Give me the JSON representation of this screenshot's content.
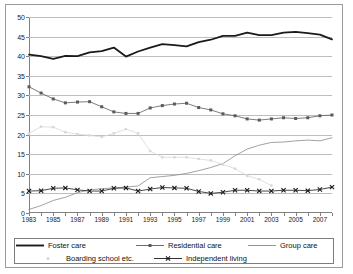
{
  "chart_data": {
    "type": "line",
    "title": "",
    "subtitle": "",
    "xlabel": "",
    "ylabel": "",
    "xlim": [
      1983,
      2008
    ],
    "ylim": [
      0,
      50
    ],
    "ytick_step": 5,
    "yticks": [
      0,
      5,
      10,
      15,
      20,
      25,
      30,
      35,
      40,
      45,
      50
    ],
    "ytick_labels": [
      "0",
      "5",
      "10",
      "15",
      "20",
      "25",
      "30",
      "35",
      "40",
      "45",
      "50"
    ],
    "x": [
      1983,
      1984,
      1985,
      1986,
      1987,
      1988,
      1989,
      1990,
      1991,
      1992,
      1993,
      1994,
      1995,
      1996,
      1997,
      1998,
      1999,
      2000,
      2001,
      2002,
      2003,
      2004,
      2005,
      2006,
      2007,
      2008
    ],
    "xtick_labels": [
      "1983",
      "1985",
      "1987",
      "1989",
      "1991",
      "1993",
      "1995",
      "1997",
      "1999",
      "2001",
      "2003",
      "2005",
      "2007"
    ],
    "xticks_shown": [
      1983,
      1985,
      1987,
      1989,
      1991,
      1993,
      1995,
      1997,
      1999,
      2001,
      2003,
      2005,
      2007
    ],
    "grid": true,
    "grid_axis": "y",
    "legend_position": "bottom",
    "series": [
      {
        "name": "Foster care",
        "color": "#1a1a1a",
        "marker": "none",
        "width": 1.8,
        "values": [
          40.4,
          40.0,
          39.3,
          40.1,
          40.0,
          41.0,
          41.3,
          42.2,
          39.9,
          41.2,
          42.2,
          43.1,
          42.8,
          42.5,
          43.6,
          44.2,
          45.2,
          45.2,
          46.0,
          45.4,
          45.4,
          46.0,
          46.2,
          45.9,
          45.5,
          44.3
        ]
      },
      {
        "name": "Residential care",
        "color": "#5a5a5a",
        "marker": "square",
        "width": 0.8,
        "values": [
          32.2,
          30.6,
          29.1,
          28.1,
          28.3,
          28.4,
          27.1,
          25.8,
          25.4,
          25.4,
          26.8,
          27.4,
          27.8,
          28.0,
          26.9,
          26.3,
          25.3,
          24.8,
          24.0,
          23.7,
          24.0,
          24.3,
          24.1,
          24.3,
          24.8,
          25.0
        ]
      },
      {
        "name": "Group care",
        "color": "#8a8a8a",
        "marker": "none",
        "width": 0.8,
        "values": [
          0.9,
          1.9,
          3.2,
          4.0,
          5.2,
          5.9,
          6.2,
          6.4,
          6.6,
          6.9,
          9.0,
          9.3,
          9.6,
          10.1,
          10.8,
          11.6,
          12.6,
          14.6,
          16.3,
          17.3,
          18.0,
          18.1,
          18.4,
          18.6,
          18.4,
          19.2
        ]
      },
      {
        "name": "Boarding school etc.",
        "color": "#d8d8d8",
        "marker": "dot",
        "width": 0.8,
        "values": [
          20.3,
          22.0,
          21.9,
          20.6,
          20.1,
          19.8,
          19.4,
          20.3,
          21.4,
          20.3,
          15.8,
          14.2,
          14.2,
          14.2,
          13.8,
          13.4,
          12.4,
          11.3,
          9.5,
          8.6,
          7.0,
          null,
          null,
          null,
          null,
          null
        ]
      },
      {
        "name": "Independent living",
        "color": "#1a1a1a",
        "marker": "x",
        "width": 0.8,
        "values": [
          5.6,
          5.7,
          6.3,
          6.4,
          5.9,
          5.6,
          5.6,
          6.3,
          6.4,
          5.6,
          6.1,
          6.5,
          6.4,
          6.3,
          5.5,
          5.0,
          5.3,
          5.8,
          5.8,
          5.6,
          5.6,
          5.8,
          5.8,
          5.7,
          6.0,
          6.6
        ]
      }
    ]
  },
  "legend": {
    "rows": [
      [
        {
          "label": "Foster care",
          "style": "thick-line"
        },
        {
          "label": "Residential care",
          "style": "line-square"
        },
        {
          "label": "Group care",
          "style": "thin-line"
        }
      ],
      [
        {
          "label": "Boarding school etc.",
          "style": "faint-dot"
        },
        {
          "label": "Independent living",
          "style": "line-x"
        }
      ]
    ]
  }
}
